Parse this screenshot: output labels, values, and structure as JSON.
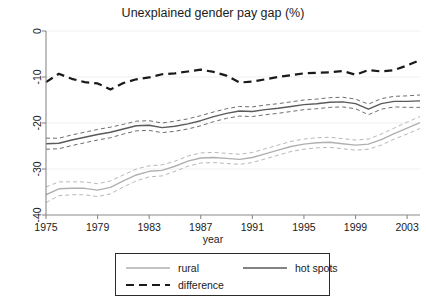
{
  "chart_data": {
    "type": "line",
    "title": "Unexplained gender pay gap (%)",
    "xlabel": "year",
    "ylabel": "",
    "xlim": [
      1975,
      2004
    ],
    "ylim": [
      -40,
      0
    ],
    "grid": true,
    "grid_axis": "y",
    "legend_position": "bottom-outside",
    "xticks": [
      1975,
      1979,
      1983,
      1987,
      1991,
      1995,
      1999,
      2003
    ],
    "xtick_labels": [
      "1975",
      "1979",
      "1983",
      "1987",
      "1991",
      "1995",
      "1999",
      "2003"
    ],
    "yticks": [
      0,
      -10,
      -20,
      -30,
      -40
    ],
    "ytick_labels": [
      "0",
      "-10",
      "-20",
      "-30",
      "-40"
    ],
    "x": [
      1975,
      1976,
      1977,
      1978,
      1979,
      1980,
      1981,
      1982,
      1983,
      1984,
      1985,
      1986,
      1987,
      1988,
      1989,
      1990,
      1991,
      1992,
      1993,
      1994,
      1995,
      1996,
      1997,
      1998,
      1999,
      2000,
      2001,
      2002,
      2003,
      2004
    ],
    "series": [
      {
        "name": "rural",
        "style": "solid",
        "color": "#b0b0b0",
        "values": [
          -35.6,
          -34.3,
          -34.2,
          -34.2,
          -34.6,
          -34.0,
          -32.6,
          -31.3,
          -30.5,
          -30.3,
          -29.4,
          -28.3,
          -27.6,
          -27.5,
          -27.7,
          -27.9,
          -27.5,
          -26.7,
          -25.9,
          -25.1,
          -24.6,
          -24.3,
          -24.2,
          -24.5,
          -24.8,
          -24.6,
          -23.6,
          -22.3,
          -21.1,
          -19.9
        ]
      },
      {
        "name": "rural_ci_upper",
        "style": "dashed",
        "color": "#b8b8b8",
        "values": [
          -33.9,
          -32.8,
          -32.8,
          -32.8,
          -33.2,
          -32.6,
          -31.3,
          -30.0,
          -29.3,
          -29.1,
          -28.3,
          -27.2,
          -26.5,
          -26.4,
          -26.6,
          -26.8,
          -26.4,
          -25.6,
          -24.8,
          -24.0,
          -23.5,
          -23.2,
          -23.1,
          -23.4,
          -23.7,
          -23.5,
          -22.4,
          -21.1,
          -19.8,
          -18.6
        ]
      },
      {
        "name": "rural_ci_lower",
        "style": "dashed",
        "color": "#b8b8b8",
        "values": [
          -37.3,
          -35.8,
          -35.6,
          -35.6,
          -36.0,
          -35.4,
          -33.9,
          -32.6,
          -31.7,
          -31.5,
          -30.5,
          -29.4,
          -28.7,
          -28.6,
          -28.8,
          -29.0,
          -28.6,
          -27.8,
          -27.0,
          -26.2,
          -25.7,
          -25.4,
          -25.3,
          -25.6,
          -25.9,
          -25.7,
          -24.8,
          -23.5,
          -22.4,
          -21.2
        ]
      },
      {
        "name": "hot spots",
        "style": "solid",
        "color": "#5a5a5a",
        "values": [
          -24.5,
          -24.4,
          -23.7,
          -23.1,
          -22.5,
          -22.0,
          -21.3,
          -20.6,
          -20.5,
          -21.0,
          -20.7,
          -20.2,
          -19.5,
          -18.6,
          -17.9,
          -17.4,
          -17.5,
          -17.1,
          -16.8,
          -16.4,
          -16.0,
          -15.8,
          -15.5,
          -15.4,
          -15.8,
          -17.0,
          -15.8,
          -15.3,
          -15.3,
          -15.2
        ]
      },
      {
        "name": "hot_spots_ci_upper",
        "style": "dashed",
        "color": "#6e6e6e",
        "values": [
          -23.3,
          -23.3,
          -22.6,
          -22.0,
          -21.4,
          -20.9,
          -20.3,
          -19.6,
          -19.5,
          -20.0,
          -19.6,
          -19.1,
          -18.4,
          -17.6,
          -16.9,
          -16.4,
          -16.5,
          -16.1,
          -15.8,
          -15.4,
          -15.0,
          -14.8,
          -14.5,
          -14.4,
          -14.8,
          -15.9,
          -14.7,
          -14.2,
          -14.1,
          -13.9
        ]
      },
      {
        "name": "hot_spots_ci_lower",
        "style": "dashed",
        "color": "#6e6e6e",
        "values": [
          -25.7,
          -25.6,
          -24.9,
          -24.3,
          -23.7,
          -23.2,
          -22.4,
          -21.7,
          -21.6,
          -22.1,
          -21.8,
          -21.3,
          -20.6,
          -19.7,
          -19.0,
          -18.5,
          -18.6,
          -18.2,
          -17.9,
          -17.5,
          -17.1,
          -16.9,
          -16.6,
          -16.5,
          -16.9,
          -18.2,
          -17.0,
          -16.5,
          -16.6,
          -16.6
        ]
      },
      {
        "name": "difference",
        "style": "dashed",
        "color": "#1a1a1a",
        "values": [
          -11.1,
          -9.3,
          -10.4,
          -11.1,
          -11.4,
          -12.7,
          -11.3,
          -10.5,
          -10.1,
          -9.4,
          -9.2,
          -8.8,
          -8.4,
          -8.9,
          -9.7,
          -11.2,
          -11.0,
          -10.5,
          -10.0,
          -9.6,
          -9.2,
          -9.1,
          -9.0,
          -8.7,
          -9.5,
          -8.5,
          -8.8,
          -8.5,
          -7.5,
          -6.3
        ]
      }
    ]
  },
  "legend": {
    "entries": [
      {
        "label": "rural",
        "style": "solid",
        "color": "#b0b0b0"
      },
      {
        "label": "hot spots",
        "style": "solid",
        "color": "#5a5a5a"
      },
      {
        "label": "difference",
        "style": "dashed",
        "color": "#1a1a1a"
      }
    ]
  }
}
